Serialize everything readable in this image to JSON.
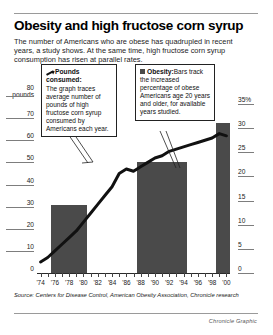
{
  "title": "Obesity and high fructose corn syrup",
  "deck": "The number of Americans who are obese has quadrupled in recent years, a study shows. At the same time, high fructose corn syrup consumption has risen at parallel rates.",
  "callouts": [
    {
      "icon": "pen-icon",
      "heading": "Pounds consumed:",
      "body": "The graph traces average number of pounds of high fructose corn syrup consumed by Americans each year."
    },
    {
      "icon": "bar-swatch-icon",
      "heading": "Obesity:",
      "body": "Bars track the increased percentage of obese Americans age 20 years and older, for available years studied."
    }
  ],
  "source": "Source: Centers for Disease Control, American Obesity Association, Chronicle research",
  "credit": "Chronicle Graphic",
  "chart_data": {
    "type": "line",
    "title": "Obesity and high fructose corn syrup",
    "xlabel": "",
    "ylabel": "pounds",
    "y2label": "%",
    "ylim": [
      0,
      80
    ],
    "y2lim": [
      0,
      35
    ],
    "grid": true,
    "legend_position": "inset-callouts",
    "left_axis": {
      "unit_label": "pounds",
      "ticks": [
        80,
        70,
        60,
        50,
        40,
        30,
        20,
        10,
        0
      ]
    },
    "right_axis": {
      "unit_label": "%",
      "ticks": [
        "35%",
        "30",
        "25",
        "20",
        "15",
        "10",
        "5",
        "0"
      ]
    },
    "x_tick_labels": [
      "'74",
      "'76",
      "'78",
      "'80",
      "'82",
      "'84",
      "'86",
      "'88",
      "'90",
      "'92",
      "'94",
      "'96",
      "'98",
      "'00"
    ],
    "series": [
      {
        "name": "Pounds consumed",
        "type": "line",
        "axis": "left",
        "unit": "pounds",
        "color": "#111111",
        "x": [
          "'74",
          "'75",
          "'76",
          "'77",
          "'78",
          "'79",
          "'80",
          "'81",
          "'82",
          "'83",
          "'84",
          "'85",
          "'86",
          "'87",
          "'88",
          "'89",
          "'90",
          "'91",
          "'92",
          "'93",
          "'94",
          "'95",
          "'96",
          "'97",
          "'98",
          "'99",
          "'00"
        ],
        "values": [
          5,
          7,
          10,
          13,
          16,
          19,
          23,
          27,
          31,
          35,
          39,
          45,
          47,
          46,
          48,
          50,
          52,
          53,
          55,
          56,
          57,
          58,
          59,
          60,
          61,
          63,
          62
        ]
      },
      {
        "name": "Obesity",
        "type": "bar",
        "axis": "right",
        "unit": "%",
        "color": "#4a4a4a",
        "bars": [
          {
            "label": "'76-'80",
            "x_start": "'76",
            "x_end": "'80",
            "value": 14
          },
          {
            "label": "'88-'94",
            "x_start": "'88",
            "x_end": "'94",
            "value": 23
          },
          {
            "label": "'99-'00",
            "x_start": "'99",
            "x_end": "'00",
            "value": 31
          }
        ]
      }
    ]
  }
}
